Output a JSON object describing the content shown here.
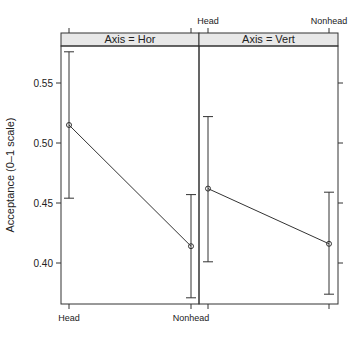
{
  "chart_data": {
    "type": "line",
    "subtype": "faceted point-range plot with error bars",
    "title": "",
    "ylabel": "Acceptance (0–1 scale)",
    "xlabel": "",
    "ylim": [
      0.365,
      0.59
    ],
    "yticks": [
      0.4,
      0.45,
      0.5,
      0.55
    ],
    "ytick_labels": [
      "0.40",
      "0.45",
      "0.50",
      "0.55"
    ],
    "categories": [
      "Head",
      "Nonhead"
    ],
    "grid": false,
    "legend": null,
    "panels": [
      {
        "strip_label": "Axis = Hor",
        "points": [
          {
            "x": "Head",
            "y": 0.515,
            "lower": 0.454,
            "upper": 0.576
          },
          {
            "x": "Nonhead",
            "y": 0.414,
            "lower": 0.371,
            "upper": 0.457
          }
        ]
      },
      {
        "strip_label": "Axis = Vert",
        "points": [
          {
            "x": "Head",
            "y": 0.462,
            "lower": 0.401,
            "upper": 0.522
          },
          {
            "x": "Nonhead",
            "y": 0.416,
            "lower": 0.374,
            "upper": 0.459
          }
        ]
      }
    ],
    "colors": {
      "strip_fill": "#e8e8e8",
      "line": "#333333",
      "frame": "#333333"
    }
  }
}
